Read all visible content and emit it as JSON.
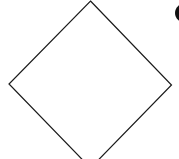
{
  "diagram": {
    "shapes": [
      {
        "type": "diamond",
        "label": "",
        "stroke": "#1a1a1a",
        "fill": "#ffffff"
      },
      {
        "type": "partial-glyph",
        "fill": "#111111"
      }
    ]
  }
}
